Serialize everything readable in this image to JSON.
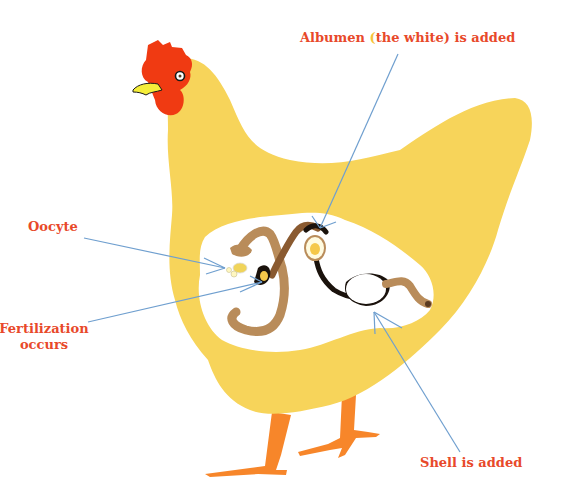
{
  "diagram": {
    "labels": {
      "albumen": {
        "pre": "Albumen ",
        "paren": "(",
        "post": "the white) is added"
      },
      "oocyte": "Oocyte",
      "fertilization_line1": "Fertilization",
      "fertilization_line2": "occurs",
      "shell": "Shell is added"
    },
    "colors": {
      "label_text": "#e8492a",
      "body": "#f7d45a",
      "comb": "#f03a12",
      "beak": "#f5ee3a",
      "legs": "#f7862a",
      "oviduct_light": "#b98c5a",
      "oviduct_dark": "#1a120c",
      "cavity": "#ffffff",
      "pointer_lines": "#6f9fcf"
    }
  }
}
